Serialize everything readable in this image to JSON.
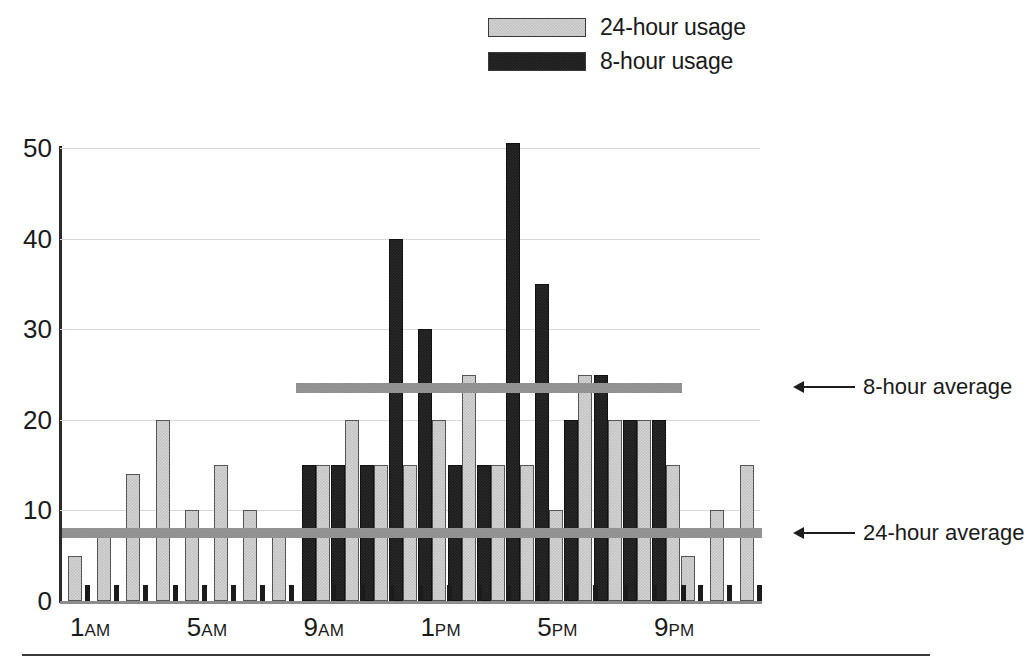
{
  "legend": {
    "items": [
      {
        "label": "24-hour usage",
        "swatch": "light-gray-swatch",
        "color": "#c3c3c3"
      },
      {
        "label": "8-hour usage",
        "swatch": "black-swatch",
        "color": "#1c1c1c"
      }
    ]
  },
  "annotations": [
    {
      "label": "8-hour average",
      "icon": "left-arrow-icon",
      "value": 23.5
    },
    {
      "label": "24-hour average",
      "icon": "left-arrow-icon",
      "value": 7.5
    }
  ],
  "axis": {
    "y_ticks": [
      "0",
      "10",
      "20",
      "30",
      "40",
      "50"
    ],
    "x_ticks": [
      {
        "hour": "1",
        "period": "AM"
      },
      {
        "hour": "5",
        "period": "AM"
      },
      {
        "hour": "9",
        "period": "AM"
      },
      {
        "hour": "1",
        "period": "PM"
      },
      {
        "hour": "5",
        "period": "PM"
      },
      {
        "hour": "9",
        "period": "PM"
      }
    ]
  },
  "chart_data": {
    "type": "bar",
    "title": "",
    "xlabel": "",
    "ylabel": "",
    "ylim": [
      0,
      50
    ],
    "yticks": [
      0,
      10,
      20,
      30,
      40,
      50
    ],
    "grid": true,
    "legend_position": "top-center",
    "categories": [
      "1AM",
      "2AM",
      "3AM",
      "4AM",
      "5AM",
      "6AM",
      "7AM",
      "8AM",
      "9AM",
      "10AM",
      "11AM",
      "12PM",
      "1PM",
      "2PM",
      "3PM",
      "4PM",
      "5PM",
      "6PM",
      "7PM",
      "8PM",
      "9PM",
      "10PM",
      "11PM",
      "12AM"
    ],
    "series": [
      {
        "name": "24-hour usage",
        "color": "#c3c3c3",
        "values": [
          5,
          8,
          14,
          20,
          10,
          15,
          10,
          8,
          15,
          20,
          15,
          15,
          20,
          25,
          15,
          15,
          10,
          25,
          20,
          20,
          15,
          5,
          10,
          15
        ]
      },
      {
        "name": "8-hour usage",
        "color": "#1c1c1c",
        "values": [
          null,
          null,
          null,
          null,
          null,
          null,
          null,
          null,
          15,
          15,
          15,
          40,
          30,
          15,
          15,
          50.5,
          35,
          20,
          25,
          20,
          20,
          null,
          null,
          null
        ]
      }
    ],
    "reference_lines": [
      {
        "name": "8-hour average",
        "value": 23.5,
        "x_start": "9AM",
        "x_end": "9PM",
        "color": "#8a8a8a"
      },
      {
        "name": "24-hour average",
        "value": 7.5,
        "x_start": "1AM",
        "x_end": "12AM",
        "color": "#8a8a8a"
      }
    ]
  }
}
